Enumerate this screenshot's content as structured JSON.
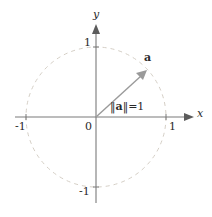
{
  "figure": {
    "kind": "unit-circle-vector-diagram"
  },
  "axes": {
    "x_label": "x",
    "y_label": "y",
    "origin_label": "0",
    "x_ticks": [
      "-1",
      "1"
    ],
    "y_ticks": [
      "1",
      "-1"
    ],
    "x_tick_pos": "-1",
    "x_tick_neg": "1",
    "tick_x_neg_label": "-1",
    "tick_x_pos_label": "1",
    "tick_y_pos_label": "1",
    "tick_y_neg_label": "-1"
  },
  "vector": {
    "name": "a",
    "label": "a",
    "norm_prefix": "‖",
    "norm_suffix": "‖",
    "norm_equals": "=",
    "norm_value": "1",
    "magnitude": 1,
    "angle_degrees": 42,
    "tip_x": 0.74,
    "tip_y": 0.67
  },
  "circle": {
    "radius_units": 1,
    "style": "dashed",
    "label": "unit circle"
  },
  "colors": {
    "axis": "#7a7a7a",
    "circle": "#d8d2c8",
    "vector": "#9a9a9a",
    "text": "#2a2a2a",
    "background": "#ffffff"
  },
  "geometry": {
    "center_px": [
      96,
      117
    ],
    "radius_px": 70
  }
}
